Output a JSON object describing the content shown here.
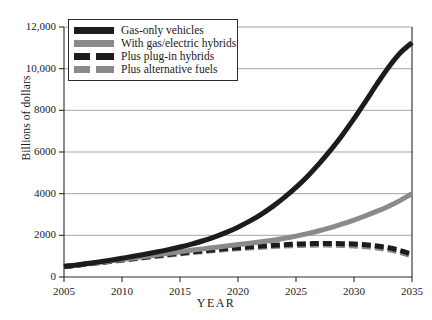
{
  "chart_data": {
    "type": "line",
    "title": "",
    "xlabel": "YEAR",
    "ylabel": "Billions of dollars",
    "xlim": [
      2005,
      2035
    ],
    "ylim": [
      0,
      12000
    ],
    "grid": true,
    "legend_position": "top-left",
    "xticks": [
      "2005",
      "2010",
      "2015",
      "2020",
      "2025",
      "2030",
      "2035"
    ],
    "yticks": [
      "0",
      "2000",
      "4000",
      "6000",
      "8000",
      "10,000",
      "12,000"
    ],
    "x": [
      2005,
      2006,
      2007,
      2008,
      2009,
      2010,
      2011,
      2012,
      2013,
      2014,
      2015,
      2016,
      2017,
      2018,
      2019,
      2020,
      2021,
      2022,
      2023,
      2024,
      2025,
      2026,
      2027,
      2028,
      2029,
      2030,
      2031,
      2032,
      2033,
      2034,
      2035
    ],
    "series": [
      {
        "name": "Gas-only vehicles",
        "style": "solid",
        "color": "#1c1c1c",
        "values": [
          500,
          570,
          645,
          725,
          810,
          900,
          995,
          1095,
          1200,
          1315,
          1440,
          1580,
          1740,
          1925,
          2140,
          2390,
          2680,
          3010,
          3390,
          3820,
          4300,
          4840,
          5440,
          6100,
          6820,
          7600,
          8430,
          9280,
          10080,
          10760,
          11250
        ]
      },
      {
        "name": "With gas/electric hybrids",
        "style": "solid",
        "color": "#8a8a8a",
        "values": [
          500,
          565,
          632,
          700,
          770,
          842,
          915,
          988,
          1062,
          1135,
          1208,
          1280,
          1350,
          1420,
          1488,
          1555,
          1620,
          1690,
          1768,
          1858,
          1962,
          2082,
          2218,
          2372,
          2545,
          2735,
          2940,
          3160,
          3400,
          3680,
          4000
        ]
      },
      {
        "name": "Plus plug-in hybrids",
        "style": "dashed",
        "color": "#1c1c1c",
        "values": [
          500,
          562,
          625,
          690,
          755,
          820,
          885,
          950,
          1015,
          1078,
          1140,
          1200,
          1258,
          1312,
          1362,
          1408,
          1450,
          1488,
          1522,
          1552,
          1578,
          1598,
          1610,
          1612,
          1602,
          1580,
          1545,
          1488,
          1400,
          1268,
          1090
        ]
      },
      {
        "name": "Plus alternative fuels",
        "style": "dashed",
        "color": "#8a8a8a",
        "values": [
          500,
          558,
          618,
          680,
          742,
          805,
          868,
          930,
          992,
          1052,
          1110,
          1166,
          1220,
          1270,
          1316,
          1358,
          1396,
          1430,
          1460,
          1486,
          1508,
          1524,
          1532,
          1530,
          1516,
          1490,
          1452,
          1392,
          1302,
          1172,
          1000
        ]
      }
    ]
  },
  "legend": {
    "items": [
      {
        "label": "Gas-only vehicles"
      },
      {
        "label": "With gas/electric hybrids"
      },
      {
        "label": "Plus plug-in hybrids"
      },
      {
        "label": "Plus alternative fuels"
      }
    ]
  }
}
